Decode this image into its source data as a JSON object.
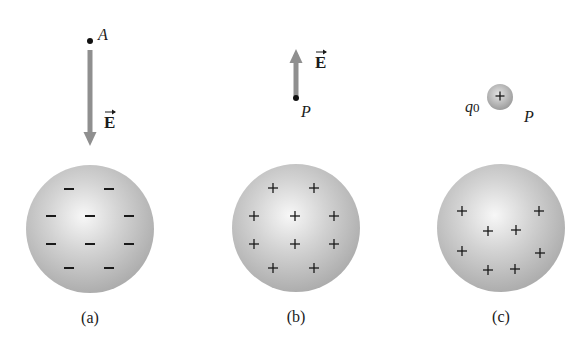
{
  "figure": {
    "panels": [
      {
        "id": "a",
        "caption": "(a)",
        "sphere": {
          "cx": 90,
          "cy": 229,
          "r": 64,
          "charge_sign": "negative",
          "charge_symbol": "−",
          "charges": [
            [
              69,
              189
            ],
            [
              109,
              189
            ],
            [
              51,
              216
            ],
            [
              90,
              216
            ],
            [
              129,
              216
            ],
            [
              51,
              244
            ],
            [
              90,
              244
            ],
            [
              129,
              244
            ],
            [
              69,
              268
            ],
            [
              109,
              268
            ]
          ]
        },
        "point": {
          "label": "A",
          "x": 90,
          "y": 41
        },
        "field": {
          "label": "E",
          "direction": "down",
          "from": [
            90,
            50
          ],
          "to": [
            90,
            146
          ],
          "label_pos": [
            104,
            128
          ]
        }
      },
      {
        "id": "b",
        "caption": "(b)",
        "sphere": {
          "cx": 296,
          "cy": 228,
          "r": 64,
          "charge_sign": "positive",
          "charge_symbol": "+",
          "charges": [
            [
              273,
              188
            ],
            [
              314,
              188
            ],
            [
              254,
              216
            ],
            [
              295,
              216
            ],
            [
              334,
              216
            ],
            [
              254,
              244
            ],
            [
              295,
              244
            ],
            [
              334,
              244
            ],
            [
              273,
              268
            ],
            [
              314,
              268
            ]
          ]
        },
        "point": {
          "label": "P",
          "x": 296,
          "y": 98
        },
        "field": {
          "label": "E",
          "direction": "up",
          "from": [
            296,
            96
          ],
          "to": [
            296,
            49
          ],
          "label_pos": [
            315,
            68
          ]
        }
      },
      {
        "id": "c",
        "caption": "(c)",
        "sphere": {
          "cx": 501,
          "cy": 228,
          "r": 64,
          "charge_sign": "positive",
          "charge_symbol": "+",
          "charges": [
            [
              462,
              211
            ],
            [
              539,
              211
            ],
            [
              488,
              231
            ],
            [
              516,
              230
            ],
            [
              462,
              251
            ],
            [
              540,
              253
            ],
            [
              488,
              270
            ],
            [
              515,
              269
            ]
          ]
        },
        "test_charge": {
          "label": "q",
          "subscript": "0",
          "symbol": "+",
          "cx": 500,
          "cy": 97,
          "r": 13
        },
        "point": {
          "label": "P",
          "x": 529,
          "y": 117
        }
      }
    ],
    "colors": {
      "sphere_light": "#f4f4f4",
      "sphere_mid": "#c9c9c9",
      "sphere_edge": "#a9a9a9",
      "arrow": "#8f8f8f",
      "ink": "#1a1a1a"
    }
  }
}
